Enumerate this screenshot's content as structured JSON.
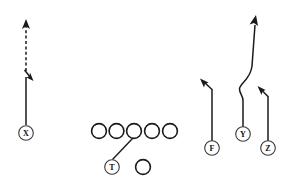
{
  "diagram": {
    "type": "american-football-play-formation",
    "width": 297,
    "height": 193,
    "background_color": "#ffffff",
    "line_color": "#1a1a1a",
    "label_color": "#111111"
  },
  "players": [
    {
      "id": "x",
      "label": "X",
      "position_name": "split-end-receiver",
      "cx": 26,
      "cy": 133,
      "r": 7.5,
      "labeled": true
    },
    {
      "id": "t",
      "label": "T",
      "position_name": "tailback",
      "cx": 112,
      "cy": 167,
      "r": 7.5,
      "labeled": true
    },
    {
      "id": "f",
      "label": "F",
      "position_name": "flanker-back",
      "cx": 212,
      "cy": 148,
      "r": 7.5,
      "labeled": true
    },
    {
      "id": "y",
      "label": "Y",
      "position_name": "tight-end-receiver",
      "cx": 243,
      "cy": 134,
      "r": 7.5,
      "labeled": true
    },
    {
      "id": "z",
      "label": "Z",
      "position_name": "flanker-receiver",
      "cx": 268,
      "cy": 148,
      "r": 7.5,
      "labeled": true
    }
  ],
  "linemen": [
    {
      "id": "lineman-1",
      "cx": 99,
      "cy": 131,
      "r": 7.6
    },
    {
      "id": "lineman-2",
      "cx": 116,
      "cy": 131,
      "r": 7.6
    },
    {
      "id": "lineman-3",
      "cx": 134,
      "cy": 131,
      "r": 7.6
    },
    {
      "id": "lineman-4",
      "cx": 152,
      "cy": 131,
      "r": 7.6
    },
    {
      "id": "lineman-5",
      "cx": 170,
      "cy": 131,
      "r": 7.6
    }
  ],
  "backs": [
    {
      "id": "back-1",
      "cx": 143,
      "cy": 167,
      "r": 7.6
    }
  ],
  "routes": [
    {
      "id": "route-x",
      "player": "X",
      "style": "solid-then-dashed",
      "description": "vertical stem with inside break then dashed continuation upfield",
      "solid_path": "M 26 125 L 26 77",
      "break_arrow_path": "M 25 70 L 33 80",
      "dashed_path": "M 26 72 L 26 26",
      "top_arrow_tip": [
        26,
        20
      ]
    },
    {
      "id": "route-t",
      "player": "T",
      "style": "solid-block",
      "description": "blocking path from tailback to center gap",
      "path": "M 112 160 L 133 138"
    },
    {
      "id": "route-f",
      "player": "F",
      "style": "solid",
      "description": "vertical stem then out-break to the left",
      "path": "M 212 140 L 212 89 L 203 82",
      "arrow_tip": [
        200,
        79
      ]
    },
    {
      "id": "route-y",
      "player": "Y",
      "style": "solid-curved",
      "description": "seam route with stem jog breaking back upfield",
      "path": "M 243 126 L 243 100 C 243 94 239 93 239 88 C 239 82 250 80 252 66 L 255 24",
      "arrow_tip": [
        256,
        16
      ]
    },
    {
      "id": "route-z",
      "player": "Z",
      "style": "solid",
      "description": "vertical stem then in-break to the left",
      "path": "M 268 140 L 268 96 L 261 89",
      "arrow_tip": [
        258,
        86
      ]
    }
  ]
}
